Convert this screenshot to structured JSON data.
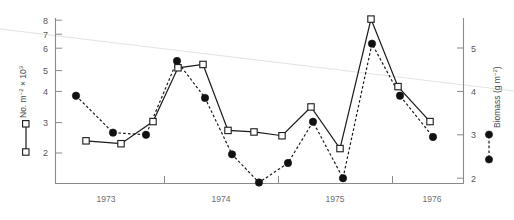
{
  "figure": {
    "width": 514,
    "height": 220,
    "background": "#ffffff",
    "ink_color": "#1a1a1a",
    "axis_color": "#8a8a8c",
    "trend_color": "#e3e3e1"
  },
  "chart_data": {
    "type": "line",
    "title": "",
    "xlabel": "",
    "grid": false,
    "legend_position": "axis-labels",
    "x_axis": {
      "tick_labels": [
        "1973",
        "1974",
        "1975",
        "1976"
      ],
      "tick_positions_px": [
        106,
        221,
        335,
        432
      ],
      "divider_positions_px": [
        164,
        278,
        392
      ],
      "range_px": [
        55,
        463
      ]
    },
    "left_axis": {
      "label": "No. m",
      "label_exp1": "−2",
      "label_mid": " × 10",
      "label_exp2": "3",
      "full_label": "No. m−2 × 103",
      "ticks": [
        2,
        3,
        4,
        5,
        6,
        7,
        8
      ],
      "ylim": [
        1.1,
        8.4
      ],
      "legend_marker": "open-square-solid-line"
    },
    "right_axis": {
      "label": "Biomass (g m",
      "label_exp": "−2",
      "label_tail": ")",
      "full_label": "Biomass (g m−2)",
      "ticks": [
        2,
        3,
        4,
        5
      ],
      "ylim": [
        1.45,
        5.55
      ],
      "legend_marker": "filled-circle-dashed-line"
    },
    "series": [
      {
        "name": "No. m-2 x 10^3",
        "marker": "open-square",
        "line": "solid",
        "axis": "left",
        "x": [
          86,
          121,
          153,
          178,
          203,
          228,
          254,
          282,
          311,
          340,
          371,
          398,
          430
        ],
        "values": [
          2.55,
          2.42,
          3.42,
          5.85,
          6.0,
          3.02,
          2.95,
          2.78,
          4.08,
          2.2,
          8.05,
          5.0,
          3.42
        ]
      },
      {
        "name": "Biomass (g m-2)",
        "marker": "filled-circle",
        "line": "dashed",
        "axis": "right",
        "x": [
          76,
          113,
          146,
          177,
          205,
          232,
          259,
          288,
          313,
          343,
          372,
          400,
          433
        ],
        "values": [
          3.9,
          3.05,
          3.0,
          4.7,
          3.85,
          2.55,
          1.9,
          2.35,
          3.3,
          2.0,
          5.1,
          3.9,
          2.95
        ]
      }
    ],
    "trend_line": {
      "name": "declining-reference-line",
      "color": "#e3e3e1",
      "x_px": [
        0,
        514
      ],
      "y_px": [
        29,
        91
      ]
    }
  }
}
